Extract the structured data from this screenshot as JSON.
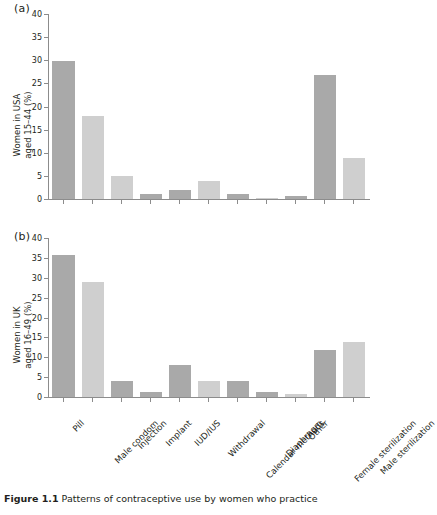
{
  "figure": {
    "caption_bold": "Figure 1.1",
    "caption_text": " Patterns of contraceptive use by women who practice"
  },
  "colors": {
    "bar_dark": "#a9a9a9",
    "bar_light": "#cfcfcf",
    "axis": "#8c8c8c",
    "text": "#231f20"
  },
  "panels": [
    {
      "label": "(a)",
      "ylabel_line1": "Women in USA",
      "ylabel_line2": "aged 15–44  (%)"
    },
    {
      "label": "(b)",
      "ylabel_line1": "Women in UK",
      "ylabel_line2": "aged 16–49  (%)"
    }
  ],
  "chart_data": [
    {
      "type": "bar",
      "title": "(a)",
      "xlabel": "",
      "ylabel": "Women in USA aged 15–44 (%)",
      "ylim": [
        0,
        40
      ],
      "yticks": [
        0,
        5,
        10,
        15,
        20,
        25,
        30,
        35,
        40
      ],
      "grid": false,
      "legend": "none",
      "categories": [
        "Pill",
        "Male condom",
        "Injection",
        "Implant",
        "IUD/IUS",
        "Withdrawal",
        "Calendar methods",
        "Diaphragm",
        "Other",
        "Female sterilization",
        "Male sterilization"
      ],
      "values": [
        30,
        18,
        5,
        1,
        2,
        4,
        1,
        0.2,
        0.7,
        27,
        9
      ],
      "bar_shades": [
        "dark",
        "light",
        "light",
        "dark",
        "dark",
        "light",
        "dark",
        "light",
        "dark",
        "dark",
        "light"
      ]
    },
    {
      "type": "bar",
      "title": "(b)",
      "xlabel": "",
      "ylabel": "Women in UK aged 16–49 (%)",
      "ylim": [
        0,
        40
      ],
      "yticks": [
        0,
        5,
        10,
        15,
        20,
        25,
        30,
        35,
        40
      ],
      "grid": false,
      "legend": "none",
      "categories": [
        "Pill",
        "Male condom",
        "Injection",
        "Implant",
        "IUD/IUS",
        "Withdrawal",
        "Calendar methods",
        "Diaphragm",
        "Other",
        "Female sterilization",
        "Male sterilization"
      ],
      "values": [
        36,
        29,
        4,
        1.2,
        8,
        4,
        4,
        1.2,
        0.8,
        12,
        14
      ],
      "bar_shades": [
        "dark",
        "light",
        "dark",
        "dark",
        "dark",
        "light",
        "dark",
        "dark",
        "light",
        "dark",
        "light"
      ]
    }
  ]
}
